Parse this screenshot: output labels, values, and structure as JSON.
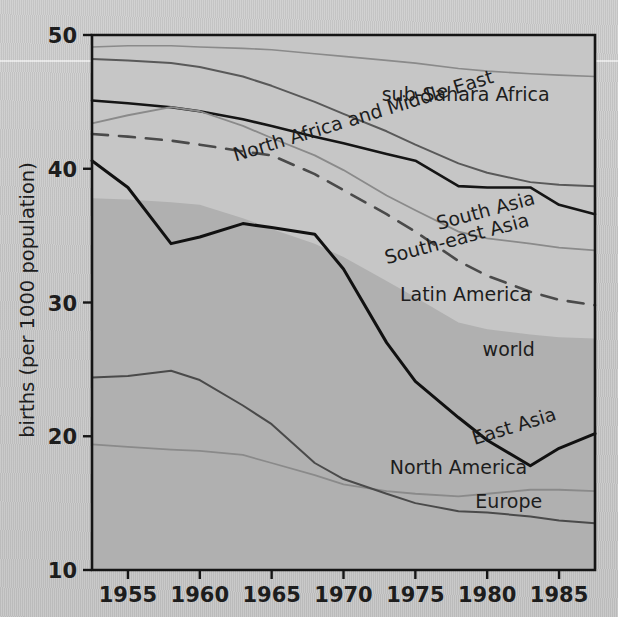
{
  "chart_data": {
    "type": "line",
    "title": "",
    "xlabel": "",
    "ylabel": "births (per 1000 population)",
    "xlim": [
      1952.5,
      1987.5
    ],
    "ylim": [
      10,
      50
    ],
    "xticks": [
      1955,
      1960,
      1965,
      1970,
      1975,
      1980,
      1985
    ],
    "xtick_labels": [
      "1955",
      "1960",
      "1965",
      "1970",
      "1975",
      "1980",
      "1985"
    ],
    "yticks": [
      10,
      20,
      30,
      40,
      50
    ],
    "ytick_labels": [
      "10",
      "20",
      "30",
      "40",
      "50"
    ],
    "grid": false,
    "legend": "inline-labels",
    "x": [
      1952.5,
      1955,
      1958,
      1960,
      1963,
      1965,
      1968,
      1970,
      1973,
      1975,
      1978,
      1980,
      1983,
      1985,
      1987.5
    ],
    "series": [
      {
        "name": "sub-Sahara Africa",
        "label": "sub-Sahara Africa",
        "style": "solid",
        "color": "#8a8a8a",
        "width": 1.6,
        "values": [
          49.1,
          49.2,
          49.2,
          49.1,
          49.0,
          48.9,
          48.6,
          48.4,
          48.1,
          47.9,
          47.5,
          47.3,
          47.1,
          47.0,
          46.9
        ]
      },
      {
        "name": "North Africa and Middle East",
        "label": "North Africa and Middle East",
        "style": "solid",
        "color": "#595959",
        "width": 2.0,
        "values": [
          48.2,
          48.1,
          47.9,
          47.6,
          46.9,
          46.2,
          45.0,
          44.1,
          42.8,
          41.8,
          40.4,
          39.7,
          39.0,
          38.8,
          38.7
        ]
      },
      {
        "name": "South Asia",
        "label": "South Asia",
        "style": "solid",
        "color": "#151515",
        "width": 2.6,
        "values": [
          45.1,
          44.9,
          44.6,
          44.3,
          43.7,
          43.2,
          42.4,
          41.9,
          41.1,
          40.6,
          38.7,
          38.6,
          38.6,
          37.3,
          36.6
        ]
      },
      {
        "name": "South-east Asia",
        "label": "South-east Asia",
        "style": "solid",
        "color": "#8a8a8a",
        "width": 1.8,
        "values": [
          43.4,
          44.0,
          44.6,
          44.3,
          43.2,
          42.3,
          41.0,
          39.9,
          38.0,
          36.9,
          35.3,
          34.8,
          34.4,
          34.1,
          33.9
        ]
      },
      {
        "name": "Latin America",
        "label": "Latin America",
        "style": "dashed",
        "color": "#4a4a4a",
        "width": 2.6,
        "values": [
          42.6,
          42.4,
          42.1,
          41.8,
          41.3,
          41.0,
          39.6,
          38.4,
          36.6,
          35.3,
          33.1,
          32.0,
          30.8,
          30.2,
          29.8
        ]
      },
      {
        "name": "East Asia",
        "label": "East Asia",
        "style": "solid",
        "color": "#111111",
        "width": 3.0,
        "values": [
          40.6,
          38.6,
          34.4,
          34.9,
          35.9,
          35.6,
          35.1,
          32.5,
          27.0,
          24.1,
          21.4,
          19.7,
          17.8,
          19.1,
          20.2
        ]
      },
      {
        "name": "North America",
        "label": "North America",
        "style": "solid",
        "color": "#8a8a8a",
        "width": 1.8,
        "values": [
          19.4,
          19.2,
          19.0,
          18.9,
          18.6,
          18.0,
          17.1,
          16.4,
          15.9,
          15.7,
          15.5,
          15.7,
          16.0,
          16.0,
          15.9
        ]
      },
      {
        "name": "Europe",
        "label": "Europe",
        "style": "solid",
        "color": "#4a4a4a",
        "width": 2.0,
        "values": [
          24.4,
          24.5,
          24.9,
          24.2,
          22.3,
          20.9,
          18.0,
          16.8,
          15.7,
          15.0,
          14.4,
          14.3,
          14.0,
          13.7,
          13.5
        ]
      }
    ],
    "band": {
      "name": "world",
      "label": "world",
      "color": "#b0b0b0",
      "description": "shaded area representing world crude birth rate",
      "upper": [
        37.8,
        37.7,
        37.5,
        37.3,
        36.3,
        35.5,
        34.4,
        33.4,
        31.6,
        30.4,
        28.5,
        28.0,
        27.6,
        27.4,
        27.3
      ],
      "lower": [
        10,
        10,
        10,
        10,
        10,
        10,
        10,
        10,
        10,
        10,
        10,
        10,
        10,
        10,
        10
      ]
    },
    "annotations": [
      {
        "text": "sub-Sahara Africa",
        "x": 1978.5,
        "y": 45.1,
        "rotation": 0
      },
      {
        "text": "North Africa and Middle East",
        "x": 1971.5,
        "y": 43.5,
        "rotation": -17
      },
      {
        "text": "South Asia",
        "x": 1980.0,
        "y": 36.4,
        "rotation": -15
      },
      {
        "text": "South-east Asia",
        "x": 1978.0,
        "y": 34.3,
        "rotation": -15
      },
      {
        "text": "Latin America",
        "x": 1978.5,
        "y": 30.1,
        "rotation": 0
      },
      {
        "text": "world",
        "x": 1981.5,
        "y": 26.0,
        "rotation": 0
      },
      {
        "text": "East Asia",
        "x": 1982.0,
        "y": 20.3,
        "rotation": -17
      },
      {
        "text": "North America",
        "x": 1978.0,
        "y": 17.2,
        "rotation": 0
      },
      {
        "text": "Europe",
        "x": 1981.5,
        "y": 14.6,
        "rotation": 0
      }
    ]
  }
}
